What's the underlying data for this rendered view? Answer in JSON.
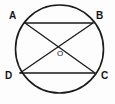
{
  "figure": {
    "kind": "circle-with-inscribed-quadrilateral-diagonals",
    "width": 115,
    "height": 104,
    "background_color": "#fdfdfd",
    "stroke_color": "#1a1a1a",
    "label_color": "#141414"
  },
  "circle": {
    "name": "circle",
    "center_x": 59.5,
    "center_y": 49,
    "radius": 44,
    "stroke_width": 1.6
  },
  "points": [
    {
      "id": "A",
      "label": "A",
      "x": 25,
      "y": 23,
      "label_x": 9,
      "label_y": 11
    },
    {
      "id": "B",
      "label": "B",
      "x": 93,
      "y": 23,
      "label_x": 96,
      "label_y": 11
    },
    {
      "id": "D",
      "label": "D",
      "x": 20,
      "y": 73,
      "label_x": 5,
      "label_y": 71
    },
    {
      "id": "C",
      "label": "C",
      "x": 95,
      "y": 73,
      "label_x": 101,
      "label_y": 71
    },
    {
      "id": "O",
      "label": "O",
      "x": 57,
      "y": 47,
      "label_x": 57,
      "label_y": 50
    }
  ],
  "segments": [
    {
      "id": "AB",
      "label": "AB",
      "from": "A",
      "to": "B",
      "x1": 25,
      "y1": 23,
      "x2": 93,
      "y2": 23,
      "stroke_width": 1.3
    },
    {
      "id": "DC",
      "label": "DC",
      "from": "D",
      "to": "C",
      "x1": 20,
      "y1": 73,
      "x2": 95,
      "y2": 73,
      "stroke_width": 1.3
    },
    {
      "id": "AC",
      "label": "AC",
      "from": "A",
      "to": "C",
      "x1": 25,
      "y1": 23,
      "x2": 95,
      "y2": 73,
      "stroke_width": 1.3
    },
    {
      "id": "DB",
      "label": "DB",
      "from": "D",
      "to": "B",
      "x1": 20,
      "y1": 73,
      "x2": 93,
      "y2": 23,
      "stroke_width": 1.3
    }
  ],
  "labels": {
    "a": "A",
    "b": "B",
    "c": "C",
    "d": "D",
    "o": "O"
  }
}
